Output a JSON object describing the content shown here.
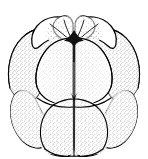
{
  "figure": {
    "title": "Cleavage-stage embryo (blastomeres)",
    "style": "black-and-white stipple and line scientific illustration",
    "background_color": "#ffffff",
    "ink_color": "#000000",
    "stipple_color": "#1a1a1a",
    "width_px": 148,
    "height_px": 159,
    "caption": "",
    "labels": [],
    "structure": {
      "tiers": [
        {
          "name": "apical-tier",
          "description": "four small rounded cells forming an arc across the top",
          "cell_count": 4
        },
        {
          "name": "equatorial-tier",
          "description": "two large anterior blastomeres meeting at a vertical midline furrow",
          "cell_count": 2
        },
        {
          "name": "basal-tier",
          "description": "four large rounded cells forming the lower half",
          "cell_count": 4
        }
      ],
      "total_visible_cells": 10,
      "midline_furrow": "vertical cleavage furrow running from apex to base",
      "junction_point": "dark triangular junction where apical and equatorial furrows meet"
    }
  }
}
